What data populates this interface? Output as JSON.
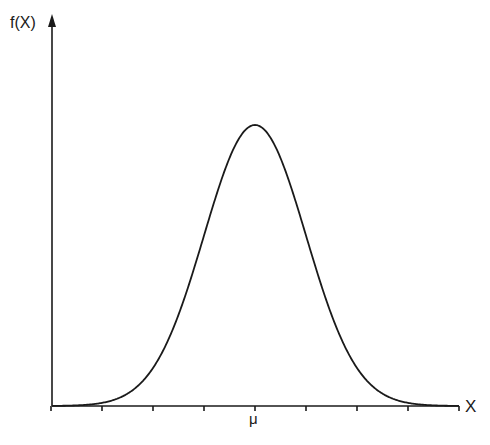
{
  "chart_data": {
    "type": "line",
    "title": "",
    "xlabel": "X",
    "ylabel": "f(X)",
    "x_tick_labels": [
      "",
      "",
      "",
      "",
      "μ",
      "",
      "",
      "",
      ""
    ],
    "x_ticks_in_sigma": [
      -4,
      -3,
      -2,
      -1,
      0,
      1,
      2,
      3,
      4
    ],
    "series": [
      {
        "name": "normal density",
        "description": "Bell-shaped normal distribution curve centered at μ",
        "x_sigma": [
          -4,
          -3,
          -2,
          -1,
          0,
          1,
          2,
          3,
          4
        ],
        "y_relative": [
          0.0003,
          0.011,
          0.135,
          0.607,
          1.0,
          0.607,
          0.135,
          0.011,
          0.0003
        ]
      }
    ],
    "grid": false,
    "legend": null
  },
  "labels": {
    "y_axis": "f(X)",
    "x_axis": "X",
    "center": "μ"
  },
  "colors": {
    "ink": "#1a1a1a",
    "background": "#ffffff"
  }
}
